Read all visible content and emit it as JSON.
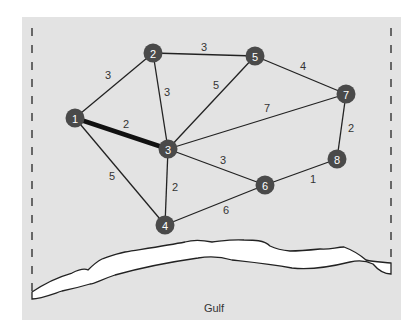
{
  "caption": "",
  "colors": {
    "panel": "#e3e3e3",
    "node": "#4a4a4a",
    "node_text": "#ffffff",
    "edge": "#222222",
    "coast_fill": "#ffffff"
  },
  "nodes": [
    {
      "id": "1",
      "label": "1",
      "x": 75,
      "y": 118
    },
    {
      "id": "2",
      "label": "2",
      "x": 153,
      "y": 53
    },
    {
      "id": "3",
      "label": "3",
      "x": 168,
      "y": 149
    },
    {
      "id": "4",
      "label": "4",
      "x": 165,
      "y": 225
    },
    {
      "id": "5",
      "label": "5",
      "x": 255,
      "y": 56
    },
    {
      "id": "6",
      "label": "6",
      "x": 265,
      "y": 185
    },
    {
      "id": "7",
      "label": "7",
      "x": 346,
      "y": 94
    },
    {
      "id": "8",
      "label": "8",
      "x": 337,
      "y": 159
    }
  ],
  "edges": [
    {
      "from": "1",
      "to": "2",
      "weight": "3",
      "lx": 108,
      "ly": 75,
      "highlight": false
    },
    {
      "from": "1",
      "to": "3",
      "weight": "2",
      "lx": 126,
      "ly": 124,
      "highlight": true
    },
    {
      "from": "1",
      "to": "4",
      "weight": "5",
      "lx": 112,
      "ly": 176,
      "highlight": false
    },
    {
      "from": "2",
      "to": "5",
      "weight": "3",
      "lx": 204,
      "ly": 47,
      "highlight": false
    },
    {
      "from": "2",
      "to": "3",
      "weight": "3",
      "lx": 167,
      "ly": 92,
      "highlight": false
    },
    {
      "from": "3",
      "to": "5",
      "weight": "5",
      "lx": 216,
      "ly": 85,
      "highlight": false
    },
    {
      "from": "3",
      "to": "7",
      "weight": "7",
      "lx": 267,
      "ly": 108,
      "highlight": false
    },
    {
      "from": "3",
      "to": "6",
      "weight": "3",
      "lx": 223,
      "ly": 160,
      "highlight": false
    },
    {
      "from": "3",
      "to": "4",
      "weight": "2",
      "lx": 175,
      "ly": 187,
      "highlight": false
    },
    {
      "from": "4",
      "to": "6",
      "weight": "6",
      "lx": 226,
      "ly": 210,
      "highlight": false
    },
    {
      "from": "5",
      "to": "7",
      "weight": "4",
      "lx": 303,
      "ly": 66,
      "highlight": false
    },
    {
      "from": "6",
      "to": "8",
      "weight": "1",
      "lx": 313,
      "ly": 179,
      "highlight": false
    },
    {
      "from": "7",
      "to": "8",
      "weight": "2",
      "lx": 351,
      "ly": 128,
      "highlight": false
    }
  ],
  "map": {
    "water_label": "Gulf"
  }
}
